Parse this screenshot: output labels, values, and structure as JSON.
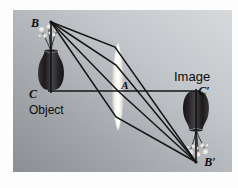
{
  "figure": {
    "type": "optics-ray-diagram",
    "canvas": {
      "width": 238,
      "height": 188
    },
    "plate": {
      "x": 13,
      "y": 10,
      "width": 219,
      "height": 162
    },
    "background": {
      "gradient_from": "#cfd2d6",
      "gradient_to": "#8e9196",
      "direction": "top-right-to-bottom-left"
    },
    "colors": {
      "line": "#141414",
      "lens_fill": "#f4f4ee",
      "lens_edge": "#cfd0cb",
      "vase_dark": "#211f20",
      "vase_mid": "#5d5a5c",
      "flower_light": "#e9e9e4",
      "label_text": "#0d0d0d",
      "page_background": "#fdfdfd"
    },
    "labels": [
      {
        "id": "B",
        "text": "B",
        "x": 35,
        "y": 27,
        "style": "italic",
        "size": 12
      },
      {
        "id": "C",
        "text": "C",
        "x": 31,
        "y": 98,
        "style": "italic",
        "size": 12
      },
      {
        "id": "Object",
        "text": "Object",
        "x": 29,
        "y": 113,
        "style": "normal",
        "size": 12
      },
      {
        "id": "A",
        "text": "A",
        "x": 124,
        "y": 88,
        "style": "italic",
        "size": 11
      },
      {
        "id": "Image",
        "text": "Image",
        "x": 174,
        "y": 80,
        "style": "normal",
        "size": 13
      },
      {
        "id": "Cprime",
        "text": "C′",
        "x": 203,
        "y": 95,
        "style": "italic",
        "size": 12
      },
      {
        "id": "Bprime",
        "text": "B′",
        "x": 206,
        "y": 166,
        "style": "italic",
        "size": 12
      }
    ],
    "points": {
      "B": {
        "x": 51,
        "y": 22,
        "label": "B"
      },
      "C": {
        "x": 48,
        "y": 91,
        "label": "C"
      },
      "A": {
        "x": 118,
        "y": 91,
        "label": "A"
      },
      "C_prime": {
        "x": 199,
        "y": 91,
        "label": "C′"
      },
      "B_prime": {
        "x": 196,
        "y": 162,
        "label": "B′"
      }
    },
    "optical_axis": {
      "x1": 48,
      "y1": 91,
      "x2": 200,
      "y2": 91
    },
    "object_arrow": {
      "x1": 51,
      "y1": 22,
      "x2": 51,
      "y2": 91,
      "note": "object height BC, upright"
    },
    "image_arrow": {
      "x1": 196,
      "y1": 91,
      "x2": 196,
      "y2": 162,
      "note": "image height C'B', inverted"
    },
    "lens": {
      "center_x": 118,
      "top_y": 42,
      "bottom_y": 131,
      "half_width": 6,
      "shape": "biconvex"
    },
    "rays": [
      {
        "name": "ray-1-top",
        "x1": 51,
        "y1": 22,
        "x2": 196,
        "y2": 162
      },
      {
        "name": "ray-2",
        "x1": 51,
        "y1": 22,
        "x2": 196,
        "y2": 162
      },
      {
        "name": "ray-3",
        "x1": 51,
        "y1": 22,
        "x2": 196,
        "y2": 162
      },
      {
        "name": "ray-4-bottom",
        "x1": 51,
        "y1": 22,
        "x2": 196,
        "y2": 162
      }
    ],
    "objects": {
      "vase_object": {
        "cx": 51,
        "base_y": 91,
        "orientation": "upright",
        "name": "flower-vase-object"
      },
      "vase_image": {
        "cx": 196,
        "base_y": 91,
        "orientation": "inverted",
        "name": "flower-vase-image"
      }
    }
  }
}
